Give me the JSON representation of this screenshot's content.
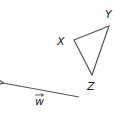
{
  "diagram": {
    "triangle": {
      "vertices": {
        "X": {
          "label": "X",
          "x": 74,
          "y": 40
        },
        "Y": {
          "label": "Y",
          "x": 109,
          "y": 26
        },
        "Z": {
          "label": "Z",
          "x": 92,
          "y": 75
        }
      },
      "stroke": "#555555"
    },
    "vector": {
      "label": "w",
      "arrow_label": "→",
      "from": {
        "x": 79,
        "y": 97
      },
      "to": {
        "x": 2,
        "y": 83
      },
      "stroke": "#555555"
    }
  }
}
